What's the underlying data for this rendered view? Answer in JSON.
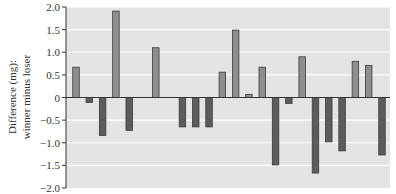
{
  "chart_data": {
    "type": "bar",
    "title": "",
    "xlabel": "",
    "ylabel": "Difference (mg): winner minus loser",
    "ylabel_lines": [
      "Difference (mg):",
      "winner minus loser"
    ],
    "ylim": [
      -2.0,
      2.0
    ],
    "yticks": [
      2.0,
      1.5,
      1.0,
      0.5,
      0,
      -0.5,
      -1.0,
      -1.5,
      -2.0
    ],
    "ytick_labels": [
      "2.0",
      "1.5",
      "1.0",
      "0.5",
      "0",
      "−0.5",
      "−1.0",
      "−1.5",
      "−2.0"
    ],
    "grid": true,
    "legend": null,
    "categories": [
      "1",
      "2",
      "3",
      "4",
      "5",
      "6",
      "7",
      "8",
      "9",
      "10",
      "11",
      "12",
      "13",
      "14",
      "15",
      "16",
      "17",
      "18",
      "19",
      "20",
      "21",
      "22",
      "23",
      "24"
    ],
    "values": [
      0.67,
      -0.11,
      -0.84,
      1.91,
      -0.73,
      0,
      1.1,
      0,
      -0.65,
      -0.65,
      -0.65,
      0.56,
      1.49,
      0.07,
      0.67,
      -1.49,
      -0.13,
      0.9,
      -1.67,
      -0.98,
      -1.18,
      0.8,
      0.71,
      -1.27
    ]
  },
  "colors": {
    "plot_background": "#e4e4e4",
    "gridline": "#ffffff",
    "positive_bar": "#8e8e8e",
    "negative_bar": "#5c5c5c",
    "bar_outline": "#3a3a3a",
    "axis": "#333333"
  }
}
